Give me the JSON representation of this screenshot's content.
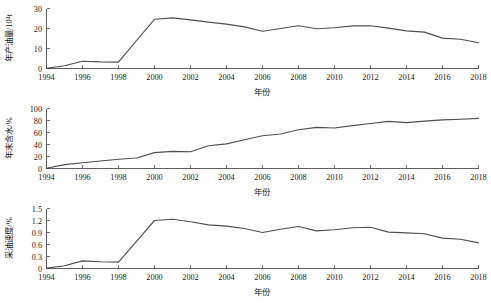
{
  "figure": {
    "background": "#ffffff",
    "line_color": "#4f4f4f",
    "axis_color": "#4d4d4d",
    "xlabel": "年份"
  },
  "chart_data": [
    {
      "type": "line",
      "title": "",
      "xlabel": "年份",
      "ylabel": "年产油量/10⁴t",
      "xlim": [
        1994,
        2018
      ],
      "ylim": [
        0,
        30
      ],
      "xticks": [
        1994,
        1996,
        1998,
        2000,
        2002,
        2004,
        2006,
        2008,
        2010,
        2012,
        2014,
        2016,
        2018
      ],
      "yticks": [
        0,
        10,
        20,
        30
      ],
      "grid": false,
      "legend": "none",
      "x": [
        1994,
        1995,
        1996,
        1997,
        1998,
        1999,
        2000,
        2001,
        2002,
        2003,
        2004,
        2005,
        2006,
        2007,
        2008,
        2009,
        2010,
        2011,
        2012,
        2013,
        2014,
        2015,
        2016,
        2017,
        2018
      ],
      "values": [
        0.1,
        1.4,
        3.6,
        3.3,
        3.2,
        14.0,
        24.6,
        25.3,
        24.3,
        23.2,
        22.2,
        20.8,
        18.6,
        20.0,
        21.4,
        19.9,
        20.4,
        21.3,
        21.4,
        20.2,
        18.8,
        18.2,
        15.2,
        14.6,
        12.9
      ]
    },
    {
      "type": "line",
      "title": "",
      "xlabel": "年份",
      "ylabel": "年末含水/%",
      "xlim": [
        1994,
        2018
      ],
      "ylim": [
        0,
        100
      ],
      "xticks": [
        1994,
        1996,
        1998,
        2000,
        2002,
        2004,
        2006,
        2008,
        2010,
        2012,
        2014,
        2016,
        2018
      ],
      "yticks": [
        0,
        20,
        40,
        60,
        80,
        100
      ],
      "grid": false,
      "legend": "none",
      "x": [
        1994,
        1995,
        1996,
        1997,
        1998,
        1999,
        2000,
        2001,
        2002,
        2003,
        2004,
        2005,
        2006,
        2007,
        2008,
        2009,
        2010,
        2011,
        2012,
        2013,
        2014,
        2015,
        2016,
        2017,
        2018
      ],
      "values": [
        0.5,
        6.5,
        9.5,
        12.5,
        15.5,
        17.5,
        26.5,
        28.5,
        28.0,
        38.0,
        41.0,
        48.0,
        54.5,
        57.5,
        64.5,
        68.5,
        67.5,
        71.5,
        75.0,
        78.5,
        76.5,
        79.0,
        81.0,
        82.0,
        83.5
      ]
    },
    {
      "type": "line",
      "title": "",
      "xlabel": "年份",
      "ylabel": "采油速度/%",
      "xlim": [
        1994,
        2018
      ],
      "ylim": [
        0,
        1.5
      ],
      "xticks": [
        1994,
        1996,
        1998,
        2000,
        2002,
        2004,
        2006,
        2008,
        2010,
        2012,
        2014,
        2016,
        2018
      ],
      "yticks": [
        0,
        0.3,
        0.6,
        0.9,
        1.2,
        1.5
      ],
      "grid": false,
      "legend": "none",
      "x": [
        1994,
        1995,
        1996,
        1997,
        1998,
        1999,
        2000,
        2001,
        2002,
        2003,
        2004,
        2005,
        2006,
        2007,
        2008,
        2009,
        2010,
        2011,
        2012,
        2013,
        2014,
        2015,
        2016,
        2017,
        2018
      ],
      "values": [
        0.01,
        0.07,
        0.19,
        0.17,
        0.16,
        0.68,
        1.2,
        1.23,
        1.17,
        1.09,
        1.06,
        1.0,
        0.9,
        0.98,
        1.05,
        0.94,
        0.97,
        1.02,
        1.03,
        0.91,
        0.89,
        0.87,
        0.76,
        0.73,
        0.64
      ]
    }
  ]
}
